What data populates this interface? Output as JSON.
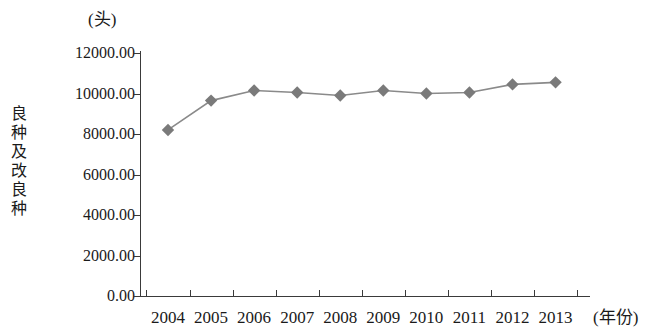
{
  "chart_data": {
    "type": "line",
    "title": "",
    "subtitle": "",
    "unit_label": "(头)",
    "ylabel": "良种及改良种",
    "xlabel": "(年份)",
    "categories": [
      "2004",
      "2005",
      "2006",
      "2007",
      "2008",
      "2009",
      "2010",
      "2011",
      "2012",
      "2013"
    ],
    "values": [
      8200,
      9650,
      10150,
      10050,
      9900,
      10150,
      10000,
      10050,
      10450,
      10550
    ],
    "series": [
      {
        "name": "良种及改良种",
        "values": [
          8200,
          9650,
          10150,
          10050,
          9900,
          10150,
          10000,
          10050,
          10450,
          10550
        ]
      }
    ],
    "ylim": [
      0,
      12000
    ],
    "ytick_values": [
      0,
      2000,
      4000,
      6000,
      8000,
      10000,
      12000
    ],
    "ytick_labels": [
      "0.00",
      "2000.00",
      "4000.00",
      "6000.00",
      "8000.00",
      "10000.00",
      "12000.00"
    ],
    "grid": false,
    "legend": "none",
    "marker": "diamond",
    "marker_color": "#7a7a7a",
    "line_color": "#8a8a8a",
    "axis_color": "#3a3a3a"
  }
}
